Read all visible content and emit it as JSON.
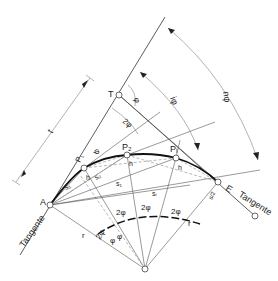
{
  "diagram": {
    "points": {
      "A": {
        "label": "A",
        "x": 50,
        "y": 205
      },
      "T": {
        "label": "T",
        "x": 119,
        "y": 95
      },
      "P1": {
        "label": "P₁",
        "x": 84,
        "y": 168
      },
      "P2": {
        "label": "P₂",
        "x": 127,
        "y": 155
      },
      "Pi": {
        "label": "Pᵢ",
        "x": 176,
        "y": 158
      },
      "E": {
        "label": "E",
        "x": 218,
        "y": 182
      },
      "M": {
        "label": "",
        "x": 145,
        "y": 269
      }
    },
    "labels": {
      "tangent_left": "Tangente",
      "tangent_right": "Tangente",
      "t": "t",
      "phi": "φ",
      "two_phi": "2φ",
      "i_phi": "iφ",
      "n_phi": "nφ",
      "s1": "s₁",
      "s2": "s₂",
      "si": "sᵢ",
      "s_i": "s₁",
      "h": "h",
      "r": "r",
      "s_half": "s/2"
    }
  }
}
